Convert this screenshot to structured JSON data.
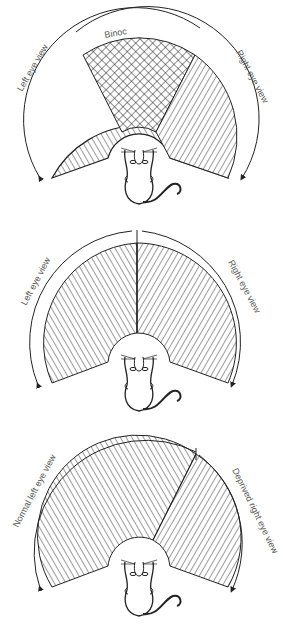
{
  "figure": {
    "panels": [
      {
        "id": "normal",
        "left_label": "Left eye view",
        "right_label": "Right eye view",
        "center_label": "Binoc"
      },
      {
        "id": "split",
        "left_label": "Left eye view",
        "right_label": "Right eye view"
      },
      {
        "id": "deprived",
        "left_label": "Normal left eye view",
        "right_label": "Deprived right eye view"
      }
    ],
    "colors": {
      "line": "#222222",
      "text": "#555555",
      "background": "#ffffff"
    }
  }
}
